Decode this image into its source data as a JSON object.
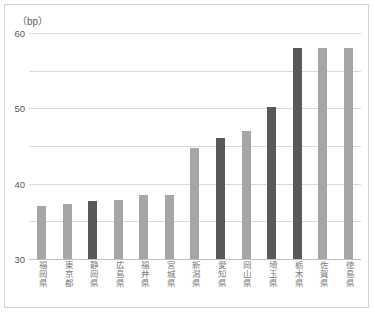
{
  "chart_data": {
    "type": "bar",
    "title": "",
    "subtitle": "",
    "xlabel": "",
    "ylabel": "（bp）",
    "y_unit": "（bp）",
    "ylim": [
      0,
      60
    ],
    "yticks": [
      0,
      10,
      20,
      30,
      40,
      50,
      60
    ],
    "ytick_labels": [
      "0",
      "10",
      "20",
      "30",
      "40",
      "50",
      "60"
    ],
    "grid": true,
    "legend": "none",
    "legend_position": "none",
    "categories": [
      "福岡県",
      "東京都",
      "静岡県",
      "広島県",
      "福井県",
      "宮城県",
      "新潟県",
      "愛知県",
      "岡山県",
      "埼玉県",
      "栃木県",
      "佐賀県",
      "徳島県"
    ],
    "values": [
      14.0,
      14.5,
      15.3,
      15.6,
      17.0,
      17.0,
      29.5,
      32.2,
      34.0,
      40.3,
      56.0,
      56.0,
      56.0
    ],
    "bar_colors": [
      "#a6a6a6",
      "#a6a6a6",
      "#595959",
      "#a6a6a6",
      "#a6a6a6",
      "#a6a6a6",
      "#a6a6a6",
      "#595959",
      "#a6a6a6",
      "#595959",
      "#595959",
      "#a6a6a6",
      "#a6a6a6"
    ],
    "colors": {
      "bar_light": "#a6a6a6",
      "bar_dark": "#595959",
      "gridline": "#d9d9d9",
      "axis": "#bfbfbf",
      "tick_text": "#5a5a5a",
      "label_text": "#7a7a7a",
      "frame": "#d0d0d0",
      "background": "#ffffff"
    }
  }
}
